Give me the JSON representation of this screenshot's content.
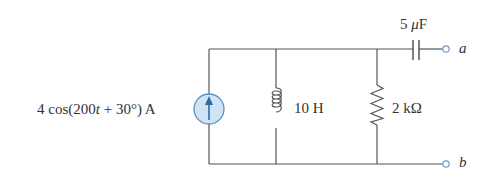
{
  "circuit": {
    "source": {
      "type": "ac-current-source",
      "label": "4 cos(200t + 30°) A",
      "label_parts": [
        "4 cos(200",
        "t",
        " + 30°) A"
      ],
      "direction": "up"
    },
    "inductor": {
      "label": "10 H"
    },
    "resistor": {
      "label": "2 kΩ"
    },
    "capacitor": {
      "label_num": "5 ",
      "label_mu": "μ",
      "label_unit": "F"
    },
    "terminals": {
      "a": "a",
      "b": "b"
    }
  },
  "colors": {
    "wire": "#555555",
    "source_fill": "#cfe3f5",
    "source_stroke": "#5a8fc0",
    "arrow": "#2c6aa6",
    "terminal": "#6a9ccc"
  }
}
